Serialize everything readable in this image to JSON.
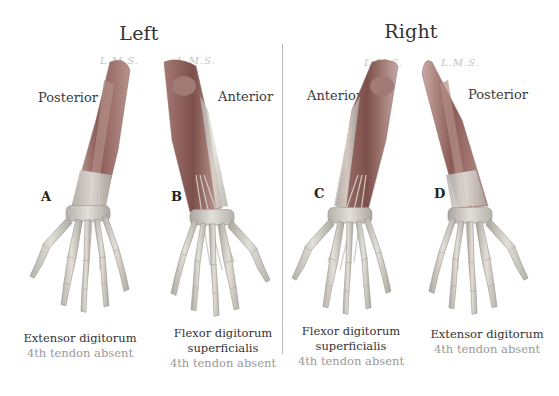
{
  "figure": {
    "sides": [
      {
        "title": "Left",
        "x": 139
      },
      {
        "title": "Right",
        "x": 411
      }
    ],
    "panels": [
      {
        "id": "A",
        "view": "Posterior",
        "muscle": "Extensor digitorum",
        "muscle_line2": "",
        "note": "4th tendon absent"
      },
      {
        "id": "B",
        "view": "Anterior",
        "muscle": "Flexor digitorum",
        "muscle_line2": "superficialis",
        "note": "4th tendon absent"
      },
      {
        "id": "C",
        "view": "Anterior",
        "muscle": "Flexor digitorum",
        "muscle_line2": "superficialis",
        "note": "4th tendon absent"
      },
      {
        "id": "D",
        "view": "Posterior",
        "muscle": "Extensor digitorum",
        "muscle_line2": "",
        "note": "4th tendon absent"
      }
    ],
    "signature": "L.M.S.",
    "colors": {
      "muscle": "#8a5a55",
      "muscle_light": "#c4a19b",
      "bone": "#d9d6d0",
      "bone_shadow": "#a8a49e",
      "text": "#333333",
      "note": "#9a9a9a",
      "divider": "#b9b9b9"
    }
  }
}
